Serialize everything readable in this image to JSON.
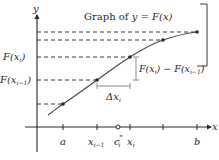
{
  "figure": {
    "title": "Graph of y = F(x)",
    "title_parts": {
      "prefix": "Graph of ",
      "expr_y": "y",
      "eq": " = ",
      "expr_F": "F",
      "expr_arg": "(x)"
    },
    "axes": {
      "x_label": "x",
      "y_label": "y"
    },
    "x_ticks": [
      {
        "label": "a",
        "x": 63
      },
      {
        "label": "x",
        "sub": "i−1",
        "x": 97
      },
      {
        "label": "c",
        "sub": "i",
        "sup": "*",
        "x": 118,
        "marker": "open-circle"
      },
      {
        "label": "x",
        "sub": "i",
        "x": 130
      },
      {
        "label": "",
        "x": 163
      },
      {
        "label": "b",
        "x": 197
      }
    ],
    "y_labels": [
      {
        "text": "F(x",
        "sub": "i",
        "close": ")",
        "y": 57
      },
      {
        "text": "F(x",
        "sub": "i−1",
        "close": ")",
        "y": 80
      }
    ],
    "annotations": {
      "delta_x": {
        "text": "Δx",
        "sub": "i"
      },
      "delta_F": {
        "text": "F(x",
        "sub1": "i",
        "mid": ") − F(x",
        "sub2": "i−1",
        "close": ")"
      }
    },
    "curve_points": [
      {
        "x": 63,
        "y": 104
      },
      {
        "x": 97,
        "y": 80
      },
      {
        "x": 130,
        "y": 57
      },
      {
        "x": 163,
        "y": 40
      },
      {
        "x": 197,
        "y": 32
      }
    ],
    "colors": {
      "ink": "#2a2a2a",
      "dash": "#3a3a3a",
      "bracket": "#8a8a8a"
    }
  }
}
